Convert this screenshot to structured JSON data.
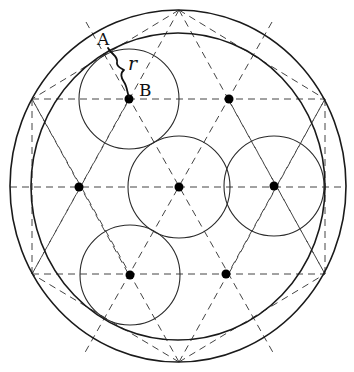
{
  "diagram": {
    "outer_circle": {
      "cx": 178,
      "cy": 186,
      "rx": 168,
      "ry": 176
    },
    "inner_circle": {
      "cx": 178,
      "cy": 186.5,
      "rx": 147,
      "ry": 153.5
    },
    "hexagon_vertices": [
      [
        179,
        10
      ],
      [
        325,
        99
      ],
      [
        325,
        274
      ],
      [
        179,
        362
      ],
      [
        32,
        274
      ],
      [
        32,
        99
      ]
    ],
    "lattice_points": [
      [
        129,
        99
      ],
      [
        229,
        99
      ],
      [
        79,
        187
      ],
      [
        179,
        187
      ],
      [
        274,
        186
      ],
      [
        130,
        275
      ],
      [
        226,
        274
      ]
    ],
    "small_circles": [
      {
        "cx": 129,
        "cy": 99,
        "r": 50
      },
      {
        "cx": 179,
        "cy": 187,
        "r": 51
      },
      {
        "cx": 274,
        "cy": 186,
        "r": 50
      },
      {
        "cx": 130,
        "cy": 275,
        "r": 50
      }
    ],
    "dashed_lines": [
      [
        32,
        99,
        325,
        99
      ],
      [
        10,
        187,
        346,
        187
      ],
      [
        32,
        274,
        325,
        274
      ],
      [
        32,
        99,
        32,
        274
      ],
      [
        325,
        99,
        325,
        274
      ],
      [
        179,
        10,
        32,
        99
      ],
      [
        179,
        10,
        325,
        99
      ],
      [
        179,
        362,
        32,
        274
      ],
      [
        179,
        362,
        325,
        274
      ],
      [
        179,
        10,
        325,
        274
      ],
      [
        179,
        10,
        32,
        274
      ],
      [
        179,
        362,
        32,
        99
      ],
      [
        179,
        362,
        325,
        99
      ],
      [
        86,
        22,
        275,
        356
      ],
      [
        272,
        22,
        83,
        356
      ],
      [
        32,
        99,
        129,
        275
      ],
      [
        325,
        99,
        228,
        275
      ],
      [
        32,
        274,
        129,
        99
      ],
      [
        325,
        274,
        228,
        99
      ]
    ],
    "labels": {
      "A": {
        "text": "A",
        "x": 97,
        "y": 45
      },
      "r": {
        "text": "r",
        "x": 128,
        "y": 70
      },
      "B": {
        "text": "B",
        "x": 139,
        "y": 96
      }
    },
    "colors": {
      "stroke": "#1a1a1a",
      "background": "#ffffff"
    }
  }
}
